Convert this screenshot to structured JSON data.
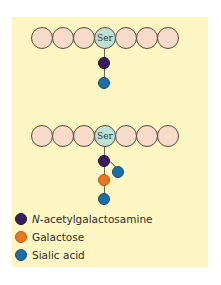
{
  "figure": {
    "chain_label": "Ser",
    "rows": [
      {
        "name": "row-1",
        "glycan": [
          "N-acetylgalactosamine",
          "Sialic acid"
        ]
      },
      {
        "name": "row-2",
        "glycan": [
          "N-acetylgalactosamine",
          "Galactose",
          "Sialic acid",
          "Sialic acid"
        ]
      }
    ]
  },
  "legend": {
    "items": [
      {
        "prefix": "N",
        "label": "-acetylgalactosamine",
        "color": "#3a1d5c"
      },
      {
        "prefix": "",
        "label": "Galactose",
        "color": "#e87722"
      },
      {
        "prefix": "",
        "label": "Sialic acid",
        "color": "#1b6ea8"
      }
    ]
  },
  "colors": {
    "panel": "#fdf6c3",
    "bead": "#f6dcc8",
    "serine": "#bfe0d4"
  }
}
